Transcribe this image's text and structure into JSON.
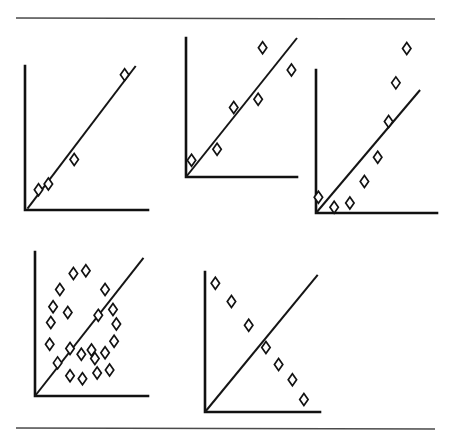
{
  "figure": {
    "title": "",
    "background_color": "#ffffff",
    "ink_color": "#121212",
    "rule_color": "#4a4a4a",
    "width": 453,
    "height": 441,
    "rules": [
      {
        "name": "top-rule",
        "x1": 16,
        "y1": 18,
        "x2": 435,
        "y2": 19
      },
      {
        "name": "bottom-rule",
        "x1": 16,
        "y1": 428,
        "x2": 435,
        "y2": 429
      }
    ]
  },
  "chart_data": [
    {
      "id": "panel-1",
      "name": "perfect-positive-correlation",
      "type": "scatter",
      "title": "",
      "xlabel": "",
      "ylabel": "",
      "grid": false,
      "legend": "none",
      "xlim": [
        0,
        100
      ],
      "ylim": [
        0,
        100
      ],
      "axes": {
        "origin_x": 25,
        "origin_y": 210,
        "top_y": 66,
        "right_x": 148
      },
      "points": [
        {
          "x": 11,
          "y": 14
        },
        {
          "x": 19,
          "y": 18
        },
        {
          "x": 40,
          "y": 35
        },
        {
          "x": 81,
          "y": 94
        }
      ],
      "fit_line": {
        "x1": 2,
        "y1": 1,
        "x2": 90,
        "y2": 100
      }
    },
    {
      "id": "panel-2",
      "name": "strong-positive-correlation",
      "type": "scatter",
      "title": "",
      "xlabel": "",
      "ylabel": "",
      "grid": false,
      "legend": "none",
      "xlim": [
        0,
        100
      ],
      "ylim": [
        0,
        100
      ],
      "axes": {
        "origin_x": 186,
        "origin_y": 177,
        "top_y": 38,
        "right_x": 297
      },
      "points": [
        {
          "x": 5,
          "y": 12
        },
        {
          "x": 28,
          "y": 20
        },
        {
          "x": 43,
          "y": 50
        },
        {
          "x": 65,
          "y": 56
        },
        {
          "x": 69,
          "y": 93
        },
        {
          "x": 95,
          "y": 77
        }
      ],
      "fit_line": {
        "x1": 0,
        "y1": 0,
        "x2": 100,
        "y2": 100
      }
    },
    {
      "id": "panel-3",
      "name": "moderate-positive-correlation",
      "type": "scatter",
      "title": "",
      "xlabel": "",
      "ylabel": "",
      "grid": false,
      "legend": "none",
      "xlim": [
        0,
        100
      ],
      "ylim": [
        0,
        100
      ],
      "axes": {
        "origin_x": 316,
        "origin_y": 213,
        "top_y": 70,
        "right_x": 437
      },
      "points": [
        {
          "x": 2,
          "y": 11
        },
        {
          "x": 15,
          "y": 4
        },
        {
          "x": 28,
          "y": 7
        },
        {
          "x": 40,
          "y": 22
        },
        {
          "x": 51,
          "y": 39
        },
        {
          "x": 60,
          "y": 64
        },
        {
          "x": 66,
          "y": 91
        },
        {
          "x": 75,
          "y": 115
        }
      ],
      "fit_line": {
        "x1": 0,
        "y1": 0,
        "x2": 86,
        "y2": 86
      }
    },
    {
      "id": "panel-4",
      "name": "no-correlation",
      "type": "scatter",
      "title": "",
      "xlabel": "",
      "ylabel": "",
      "grid": false,
      "legend": "none",
      "xlim": [
        0,
        100
      ],
      "ylim": [
        0,
        100
      ],
      "axes": {
        "origin_x": 35,
        "origin_y": 396,
        "top_y": 252,
        "right_x": 148
      },
      "points": [
        {
          "x": 34,
          "y": 85
        },
        {
          "x": 45,
          "y": 87
        },
        {
          "x": 22,
          "y": 74
        },
        {
          "x": 16,
          "y": 62
        },
        {
          "x": 29,
          "y": 58
        },
        {
          "x": 14,
          "y": 51
        },
        {
          "x": 56,
          "y": 56
        },
        {
          "x": 62,
          "y": 74
        },
        {
          "x": 69,
          "y": 60
        },
        {
          "x": 72,
          "y": 50
        },
        {
          "x": 13,
          "y": 36
        },
        {
          "x": 31,
          "y": 33
        },
        {
          "x": 41,
          "y": 29
        },
        {
          "x": 50,
          "y": 32
        },
        {
          "x": 62,
          "y": 30
        },
        {
          "x": 70,
          "y": 38
        },
        {
          "x": 20,
          "y": 23
        },
        {
          "x": 31,
          "y": 14
        },
        {
          "x": 42,
          "y": 12
        },
        {
          "x": 55,
          "y": 16
        },
        {
          "x": 53,
          "y": 26
        },
        {
          "x": 66,
          "y": 18
        }
      ],
      "fit_line": {
        "x1": 0,
        "y1": 0,
        "x2": 96,
        "y2": 96
      }
    },
    {
      "id": "panel-5",
      "name": "negative-correlation",
      "type": "scatter",
      "title": "",
      "xlabel": "",
      "ylabel": "",
      "grid": false,
      "legend": "none",
      "xlim": [
        0,
        100
      ],
      "ylim": [
        0,
        100
      ],
      "axes": {
        "origin_x": 205,
        "origin_y": 412,
        "top_y": 272,
        "right_x": 320
      },
      "points": [
        {
          "x": 9,
          "y": 92
        },
        {
          "x": 23,
          "y": 79
        },
        {
          "x": 38,
          "y": 62
        },
        {
          "x": 53,
          "y": 46
        },
        {
          "x": 64,
          "y": 34
        },
        {
          "x": 76,
          "y": 23
        },
        {
          "x": 86,
          "y": 9
        }
      ],
      "fit_line": {
        "x1": 0,
        "y1": 0,
        "x2": 98,
        "y2": 98
      }
    }
  ]
}
